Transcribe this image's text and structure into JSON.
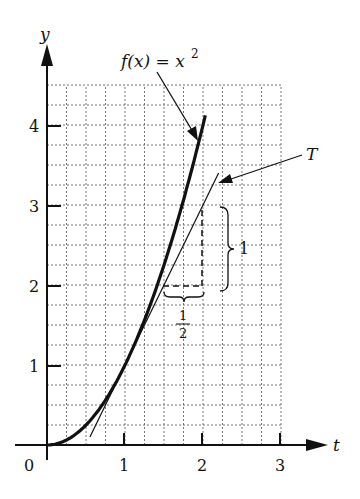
{
  "chart_data": {
    "type": "line",
    "title": "",
    "xlabel": "t",
    "ylabel": "y",
    "xlim": [
      0,
      3
    ],
    "ylim": [
      0,
      4.5
    ],
    "x_ticks": [
      "0",
      "1",
      "2",
      "3"
    ],
    "y_ticks": [
      "1",
      "2",
      "3",
      "4"
    ],
    "grid": true,
    "grid_step": 0.25,
    "series": [
      {
        "name": "f(x) = x²",
        "style": "thick",
        "x": [
          0,
          0.25,
          0.5,
          0.75,
          1,
          1.25,
          1.5,
          1.75,
          2,
          2.03
        ],
        "y": [
          0,
          0.0625,
          0.25,
          0.5625,
          1,
          1.5625,
          2.25,
          3.0625,
          4,
          4.12
        ]
      },
      {
        "name": "T",
        "style": "thin",
        "description": "tangent line at (1,1), y = 2x - 1",
        "x": [
          0.55,
          2.2
        ],
        "y": [
          0.1,
          3.4
        ]
      }
    ],
    "annotations": [
      {
        "text": "f(x) = x²",
        "arrow_to": [
          1.9,
          3.8
        ]
      },
      {
        "text": "T",
        "arrow_to": [
          2.15,
          3.3
        ]
      },
      {
        "text": "1",
        "type": "brace",
        "description": "vertical rise from y=2 to y=3 at x=2"
      },
      {
        "text": "1/2",
        "type": "brace",
        "description": "horizontal run from x=1.5 to x=2 at y=2"
      }
    ]
  },
  "labels": {
    "y_axis": "y",
    "x_axis": "t",
    "origin": "0",
    "x1": "1",
    "x2": "2",
    "x3": "3",
    "y1": "1",
    "y2": "2",
    "y3": "3",
    "y4": "4",
    "func_f": "f(x) = x",
    "func_exp": "2",
    "tangent": "T",
    "rise": "1",
    "run_num": "1",
    "run_den": "2"
  }
}
